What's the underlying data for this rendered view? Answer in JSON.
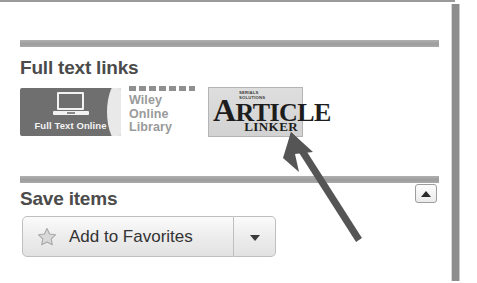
{
  "panel": {
    "right_edge_bar": "panel-scroll-edge"
  },
  "sections": [
    {
      "id": "full-text-links",
      "title": "Full text links",
      "links": [
        {
          "name": "full-text-online",
          "label": "Full Text Online",
          "icon": "laptop-icon",
          "background_color": "#6f6f6f",
          "text_color": "#f4f4f4"
        },
        {
          "name": "wiley-online-library",
          "line1": "Wiley",
          "line2": "Online",
          "line3": "Library",
          "text_color": "#9a9a9a"
        },
        {
          "name": "article-linker",
          "vendor_line1": "SERIALS",
          "vendor_line2": "SOLUTIONS",
          "word_initial": "A",
          "word_rest": "RTICLE",
          "subtitle": "LINKER",
          "background_color": "#d8d8d8"
        }
      ]
    },
    {
      "id": "save-items",
      "title": "Save items",
      "collapse_toggle": {
        "name": "collapse-section-toggle",
        "icon": "caret-up-icon"
      },
      "buttons": [
        {
          "name": "add-to-favorites",
          "label": "Add to Favorites",
          "icon": "star-icon"
        },
        {
          "name": "favorites-dropdown",
          "label": "",
          "icon": "caret-down-icon"
        }
      ]
    }
  ],
  "annotation": {
    "name": "pointer-arrow",
    "color": "#555555",
    "points_to": "article-linker",
    "from_x": 357,
    "from_y": 240,
    "to_x": 291,
    "to_y": 136
  },
  "colors": {
    "divider": "#a2a2a2",
    "heading_text": "#4b4b4b",
    "button_border": "#bfbfbf",
    "panel_background": "#ffffff"
  }
}
